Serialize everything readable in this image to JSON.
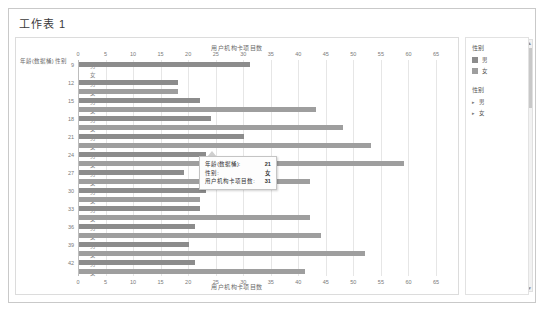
{
  "window": {
    "title": "工作表 1"
  },
  "legend_panel": {
    "heading1": "性别",
    "series_legend": [
      {
        "label": "男",
        "color": "#8c8c8c"
      },
      {
        "label": "女",
        "color": "#9e9e9e"
      }
    ],
    "heading2": "性别",
    "filters": [
      {
        "label": "男",
        "marker": "▸"
      },
      {
        "label": "女",
        "marker": "▸"
      }
    ]
  },
  "scrollbar": {
    "up": "▲",
    "down": "▼"
  },
  "tooltip": {
    "rows": [
      {
        "label": "年龄(数据桶):",
        "value": "21"
      },
      {
        "label": "性别:",
        "value": "女"
      },
      {
        "label": "用户机构卡项目数:",
        "value": "31"
      }
    ]
  },
  "chart_data": {
    "type": "bar",
    "orientation": "horizontal",
    "title": "用户机构卡项目数",
    "xlabel": "用户机构卡项目数",
    "ylabel": "年龄(数据桶) 性别",
    "xlim": [
      0,
      65
    ],
    "xticks": [
      0,
      5,
      10,
      15,
      20,
      25,
      30,
      35,
      40,
      45,
      50,
      55,
      60,
      65
    ],
    "grid": true,
    "legend_position": "right",
    "categories": [
      "9",
      "12",
      "15",
      "18",
      "21",
      "24",
      "27",
      "30",
      "33",
      "36",
      "39",
      "42"
    ],
    "subcategories": [
      "男",
      "女"
    ],
    "series": [
      {
        "name": "男",
        "color": "#8c8c8c",
        "values": [
          31,
          18,
          22,
          24,
          30,
          23,
          19,
          23,
          22,
          21,
          20,
          21
        ]
      },
      {
        "name": "女",
        "color": "#9e9e9e",
        "values": [
          0,
          18,
          43,
          48,
          53,
          59,
          42,
          22,
          42,
          44,
          52,
          41
        ]
      }
    ]
  }
}
